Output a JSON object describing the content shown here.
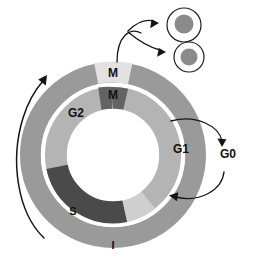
{
  "figure": {
    "labels": {
      "m_outer": "M",
      "m_inner": "M",
      "g2": "G2",
      "g1": "G1",
      "g0": "G0",
      "s": "S",
      "i": "I"
    },
    "icons": {
      "daughter_cell_top": "cell-icon",
      "daughter_cell_bottom": "cell-icon",
      "division_arrow": "fork-arrow-icon",
      "g0_exit_arrow": "curved-arrow-icon",
      "g0_return_arrow": "curved-arrow-icon",
      "cycle_direction_arrow": "curved-arrow-icon"
    },
    "colors": {
      "outer_ring": "#9a9a9a",
      "outer_ring_m": "#e2e2e2",
      "inner_ring_g1": "#b4b4b4",
      "inner_ring_m": "#636363",
      "inner_ring_s": "#4a4a4a",
      "inner_ring_light": "#cfcfcf",
      "background": "#ffffff",
      "stroke": "#151515",
      "nucleus": "#8a8a8a",
      "cell_fill": "#ffffff"
    },
    "geometry": {
      "center_x": 113,
      "center_y": 155,
      "outer_ring_outer_r": 93,
      "outer_ring_inner_r": 72,
      "inner_ring_outer_r": 68,
      "inner_ring_inner_r": 45
    },
    "segments": {
      "outer": [
        {
          "name": "interphase",
          "label": "I",
          "start_deg": -78,
          "end_deg": 282,
          "color": "#9a9a9a"
        },
        {
          "name": "mitosis",
          "label": "M",
          "start_deg": -102,
          "end_deg": -78,
          "color": "#e2e2e2"
        }
      ],
      "inner": [
        {
          "name": "m-phase",
          "label": "M",
          "start_deg": -103,
          "end_deg": -78,
          "color": "#636363"
        },
        {
          "name": "g1-phase",
          "label": "G1",
          "start_deg": -78,
          "end_deg": 52,
          "color": "#b4b4b4"
        },
        {
          "name": "transition",
          "label": "",
          "start_deg": 52,
          "end_deg": 78,
          "color": "#cfcfcf"
        },
        {
          "name": "s-phase",
          "label": "S",
          "start_deg": 78,
          "end_deg": 168,
          "color": "#4a4a4a"
        },
        {
          "name": "g2-phase",
          "label": "G2",
          "start_deg": 168,
          "end_deg": 257,
          "color": "#b4b4b4"
        }
      ]
    }
  }
}
